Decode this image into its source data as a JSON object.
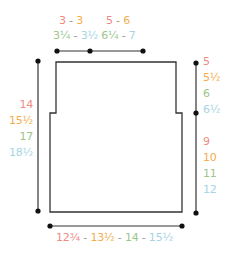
{
  "colors": {
    "size1": "#ef8a82",
    "size2": "#f3ad4c",
    "size3": "#9cc58a",
    "size4": "#a6d4e5",
    "line": "#333333"
  },
  "top": {
    "row1": {
      "a": "3",
      "sep": " - ",
      "b": "3",
      "c": "5",
      "sep2": " - ",
      "d": "6"
    },
    "row2": {
      "a": "3¼",
      "sep": " - ",
      "b": "3½",
      "c": "6¼",
      "sep2": " - ",
      "d": "7"
    }
  },
  "left": {
    "values": [
      "14",
      "15½",
      "17",
      "18½"
    ]
  },
  "right": {
    "upper": [
      "5",
      "5½",
      "6",
      "6½"
    ],
    "lower": [
      "9",
      "10",
      "11",
      "12"
    ]
  },
  "bottom": {
    "values": [
      "12¾",
      "13½",
      "14",
      "15½"
    ],
    "sep": " - "
  }
}
